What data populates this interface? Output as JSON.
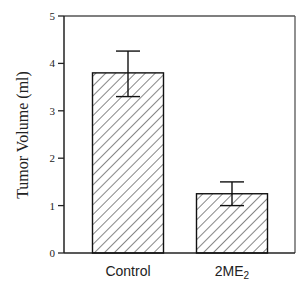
{
  "chart_data": {
    "type": "bar",
    "title": "",
    "xlabel": "",
    "ylabel": "Tumor Volume (ml)",
    "ylim": [
      0,
      5
    ],
    "yticks": [
      "0",
      "1",
      "2",
      "3",
      "4",
      "5"
    ],
    "categories": [
      "Control",
      "2ME2"
    ],
    "category_labels": [
      {
        "text": "Control",
        "subscript": ""
      },
      {
        "text": "2ME",
        "subscript": "2"
      }
    ],
    "values": [
      3.8,
      1.25
    ],
    "error_bars": [
      {
        "upper": 4.26,
        "lower": 3.3
      },
      {
        "upper": 1.5,
        "lower": 1.0
      }
    ],
    "grid": false,
    "legend": null,
    "bar_fill": "diagonal-hatch"
  },
  "colors": {
    "axis": "#222222",
    "bar_stroke": "#111111",
    "hatch": "#222222",
    "background": "#ffffff"
  }
}
